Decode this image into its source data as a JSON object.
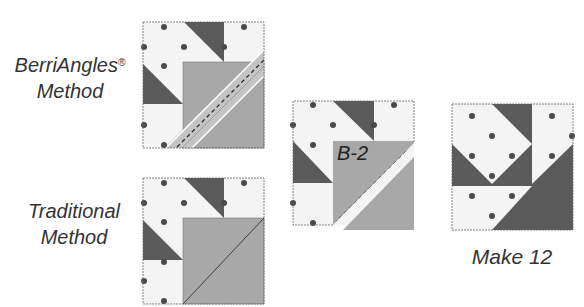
{
  "labels": {
    "berriangles_line1": "BerriAngles",
    "berriangles_reg": "®",
    "berriangles_line2": "Method",
    "traditional_line1": "Traditional",
    "traditional_line2": "Method",
    "unit_label": "B-2",
    "result_label": "Make 12"
  },
  "colors": {
    "light_fabric": "#f4f4f4",
    "dark_fabric": "#5a5a5a",
    "medium_fabric": "#a8a8a8",
    "ruler": "#c4c4c4",
    "dot": "#4a4a4a",
    "outline": "#666666"
  }
}
